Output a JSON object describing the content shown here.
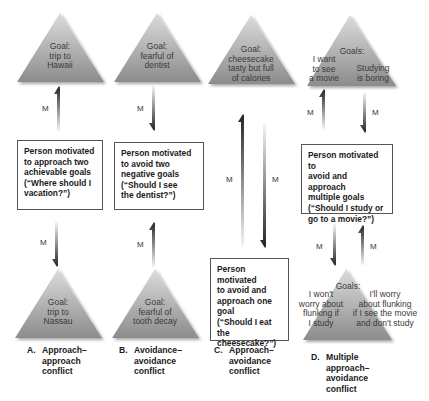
{
  "diagram": {
    "columns": [
      {
        "id": "A",
        "top_goal": [
          "Goal:",
          "trip to",
          "Hawaii"
        ],
        "bottom_goal": [
          "Goal:",
          "trip to",
          "Nassau"
        ],
        "box": [
          "Person motivated",
          "to approach two",
          "achievable goals",
          "(“Where should I",
          "vacation?”)"
        ],
        "arrow_top": {
          "label": "M",
          "direction": "up"
        },
        "arrow_bottom": {
          "label": "M",
          "direction": "down"
        },
        "caption_letter": "A.",
        "caption": [
          "Approach–",
          "approach",
          "conflict"
        ]
      },
      {
        "id": "B",
        "top_goal": [
          "Goal:",
          "fearful of",
          "dentist"
        ],
        "bottom_goal": [
          "Goal:",
          "fearful of",
          "tooth decay"
        ],
        "box": [
          "Person motivated",
          "to avoid two",
          "negative goals",
          "(“Should I see",
          "the dentist?”)"
        ],
        "arrow_top": {
          "label": "M",
          "direction": "down"
        },
        "arrow_bottom": {
          "label": "M",
          "direction": "up"
        },
        "caption_letter": "B.",
        "caption": [
          "Avoidance–",
          "avoidance",
          "conflict"
        ]
      },
      {
        "id": "C",
        "top_goal": [
          "Goal:",
          "cheesecake",
          "tasty but full",
          "of calories"
        ],
        "box": [
          "Person motivated",
          "to avoid and",
          "approach one",
          "goal",
          "(“Should I eat the",
          "cheesecake?”)"
        ],
        "arrow_left": {
          "label": "M",
          "direction": "up"
        },
        "arrow_right": {
          "label": "M",
          "direction": "down"
        },
        "caption_letter": "C.",
        "caption": [
          "Approach–",
          "avoidance",
          "conflict"
        ]
      },
      {
        "id": "D",
        "top_goal_title": "Goals:",
        "top_goal_left": [
          "I want",
          "to see",
          "a movie"
        ],
        "top_goal_right": [
          "Studying",
          "is boring"
        ],
        "bottom_goal_title": "Goals:",
        "bottom_goal_left": [
          "I won't",
          "worry about",
          "flunking if",
          "I study"
        ],
        "bottom_goal_right": [
          "I'll worry",
          "about flunking",
          "if I see the movie",
          "and don't study"
        ],
        "box": [
          "Person motivated to",
          "avoid and approach",
          "multiple goals",
          "(“Should I study or",
          "go to a movie?”)"
        ],
        "arrows_top": [
          {
            "label": "M",
            "direction": "up"
          },
          {
            "label": "M",
            "direction": "down"
          }
        ],
        "arrows_bottom": [
          {
            "label": "M",
            "direction": "down"
          },
          {
            "label": "M",
            "direction": "up"
          }
        ],
        "caption_letter": "D.",
        "caption": [
          "Multiple",
          "approach–",
          "avoidance",
          "conflict"
        ]
      }
    ],
    "colors": {
      "triangle_light": "#d6d6d6",
      "triangle_dark": "#8a8a8a",
      "arrow_dark": "#2a2a2a",
      "box_border": "#555555"
    }
  }
}
